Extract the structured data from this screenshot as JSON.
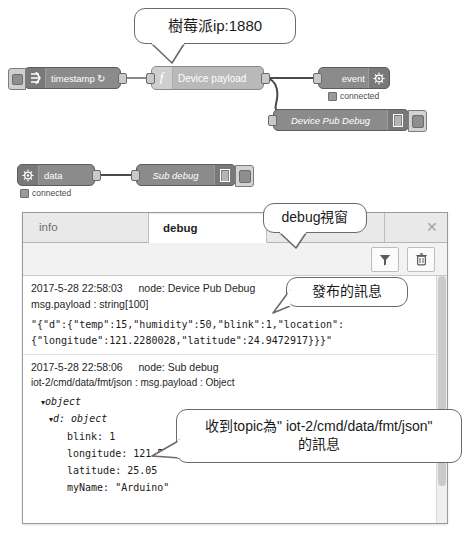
{
  "callouts": {
    "ip": "樹莓派ip:1880",
    "debug_window": "debug視窗",
    "published": "發布的訊息",
    "received_line1": "收到topic為\" iot-2/cmd/data/fmt/json\"",
    "received_line2": "的訊息"
  },
  "flow": {
    "nodes": [
      {
        "id": "timestamp",
        "label": "timestamp ↻",
        "icon": "inject-arrow-icon",
        "status": ""
      },
      {
        "id": "device-payload",
        "label": "Device payload",
        "icon": "function-f-icon",
        "status": ""
      },
      {
        "id": "event",
        "label": "event",
        "icon": "ibm-watson-iot-icon",
        "status": "connected"
      },
      {
        "id": "device-pub-debug",
        "label": "Device Pub Debug",
        "icon": "debug-bars-icon",
        "status": ""
      },
      {
        "id": "data",
        "label": "data",
        "icon": "ibm-watson-iot-icon",
        "status": "connected"
      },
      {
        "id": "sub-debug",
        "label": "Sub debug",
        "icon": "debug-bars-icon",
        "status": ""
      }
    ]
  },
  "panel": {
    "tabs": [
      {
        "label": "info",
        "active": false
      },
      {
        "label": "debug",
        "active": true
      },
      {
        "label": "d",
        "active": false
      }
    ],
    "close_label": "✕",
    "toolbar": {
      "filter_icon": "filter-funnel-icon",
      "trash_icon": "trash-can-icon"
    },
    "messages": [
      {
        "timestamp": "2017-5-28 22:58:03",
        "node_label": "node: Device Pub Debug",
        "property": "msg.payload : string[100]",
        "body_line1": "\"{\"d\":{\"temp\":15,\"humidity\":50,\"blink\":1,\"location\":",
        "body_line2": "{\"longitude\":121.2280028,\"latitude\":24.9472917}}}\""
      },
      {
        "timestamp": "2017-5-28 22:58:06",
        "node_label": "node: Sub debug",
        "property": "iot-2/cmd/data/fmt/json : msg.payload : Object",
        "tree": [
          {
            "arrow": "▾",
            "text": "object",
            "indent": 1,
            "italic": true
          },
          {
            "arrow": "▾",
            "text": "d: object",
            "indent": 1,
            "italic": true
          },
          {
            "arrow": "",
            "text": "blink: 1",
            "indent": 3,
            "italic": false
          },
          {
            "arrow": "",
            "text": "longitude: 121.51",
            "indent": 3,
            "italic": false
          },
          {
            "arrow": "",
            "text": "latitude: 25.05",
            "indent": 3,
            "italic": false
          },
          {
            "arrow": "",
            "text": "myName: \"Arduino\"",
            "indent": 3,
            "italic": false
          }
        ]
      }
    ]
  },
  "colors": {
    "node_dark": "#8b8b8b",
    "node_light": "#b9b9b9",
    "panel_bg": "#f7f7f7",
    "callout_border": "#6b6b6b"
  }
}
